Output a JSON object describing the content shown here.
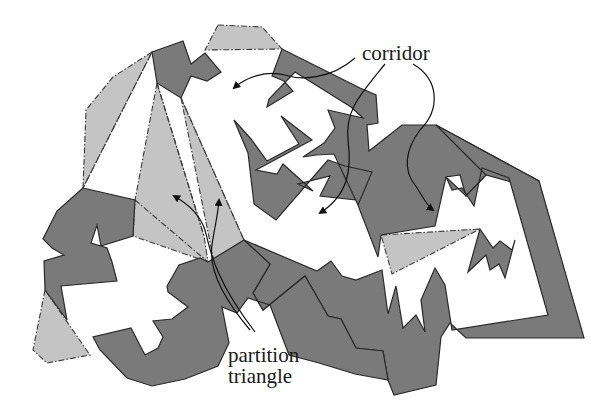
{
  "figure": {
    "type": "polygonal domain partition diagram",
    "labels": {
      "corridor": "corridor",
      "partition_line1": "partition",
      "partition_line2": "triangle"
    },
    "colors": {
      "obstacle_fill": "#7a7a7a",
      "partition_triangle_fill": "#c4c4c4",
      "free_space": "#ffffff",
      "outline": "#2a2a2a"
    },
    "legend_semantics": {
      "dark_gray_regions": "obstacles",
      "light_gray_dashed_regions": "partition triangles",
      "white_regions": "corridors"
    },
    "annotations": [
      {
        "text": "corridor",
        "arrows": 3
      },
      {
        "text": "partition triangle",
        "arrows": 2
      }
    ]
  }
}
